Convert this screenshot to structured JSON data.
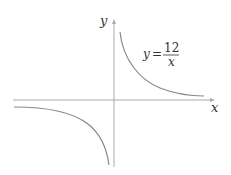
{
  "axes": {
    "x_label": "x",
    "y_label": "y",
    "color": "#aaaaaa"
  },
  "equation": {
    "lhs": "y",
    "equals": "=",
    "numerator": "12",
    "denominator": "x"
  },
  "curve": {
    "color": "#888888",
    "function": "y = 12/x",
    "branches": [
      "first-quadrant",
      "third-quadrant"
    ]
  }
}
